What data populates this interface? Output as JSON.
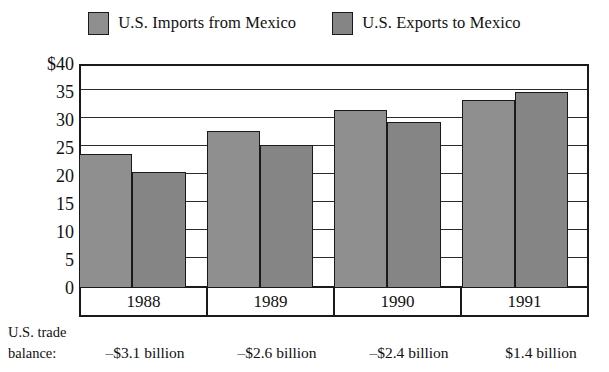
{
  "legend": {
    "items": [
      {
        "label": "U.S. Imports from Mexico",
        "color": "#8f8f8f",
        "swatch_name": "legend-swatch-imports"
      },
      {
        "label": "U.S. Exports to Mexico",
        "color": "#858585",
        "swatch_name": "legend-swatch-exports"
      }
    ]
  },
  "axis": {
    "y_ticks": [
      "$40",
      "35",
      "30",
      "25",
      "20",
      "15",
      "10",
      "5",
      "0"
    ]
  },
  "balance": {
    "caption_line1": "U.S. trade",
    "caption_line2": "balance:",
    "values": [
      "–$3.1 billion",
      "–$2.6 billion",
      "–$2.4 billion",
      "$1.4 billion"
    ]
  },
  "chart_data": {
    "type": "bar",
    "title": "",
    "xlabel": "",
    "ylabel": "",
    "ylim": [
      0,
      40
    ],
    "ytick_values": [
      40,
      35,
      30,
      25,
      20,
      15,
      10,
      5,
      0
    ],
    "grid": true,
    "legend_position": "top-center",
    "categories": [
      "1988",
      "1989",
      "1990",
      "1991"
    ],
    "series": [
      {
        "name": "U.S. Imports from Mexico",
        "color": "#8f8f8f",
        "values": [
          24.0,
          28.0,
          31.8,
          33.5
        ]
      },
      {
        "name": "U.S. Exports to Mexico",
        "color": "#858585",
        "values": [
          20.8,
          25.5,
          29.6,
          35.0
        ]
      }
    ],
    "annotations": {
      "U.S. trade balance": [
        "–$3.1 billion",
        "–$2.6 billion",
        "–$2.4 billion",
        "$1.4 billion"
      ]
    }
  }
}
